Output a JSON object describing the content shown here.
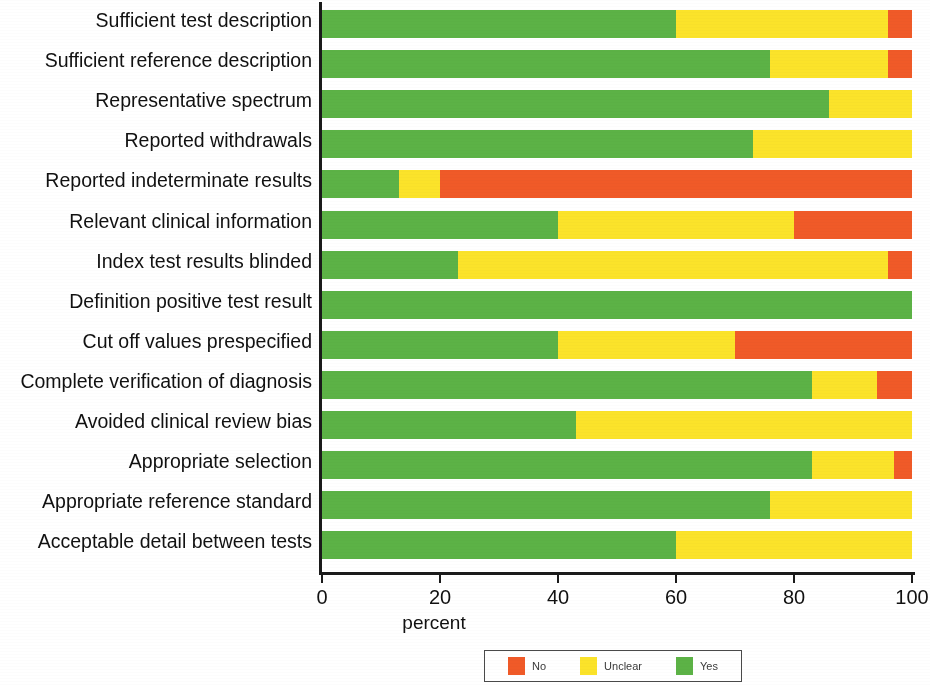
{
  "chart_data": {
    "type": "bar",
    "orientation": "horizontal",
    "stacked": true,
    "stack_mode": "percent",
    "title": "",
    "xlabel": "percent",
    "ylabel": "",
    "xlim": [
      0,
      100
    ],
    "xticks": [
      "0",
      "20",
      "40",
      "60",
      "80",
      "100"
    ],
    "grid": false,
    "legend_position": "bottom-center",
    "categories": [
      "Sufficient test description",
      "Sufficient reference description",
      "Representative spectrum",
      "Reported withdrawals",
      "Reported indeterminate results",
      "Relevant clinical information",
      "Index test results blinded",
      "Definition positive test result",
      "Cut off values prespecified",
      "Complete verification of diagnosis",
      "Avoided clinical review bias",
      "Appropriate selection",
      "Appropriate reference standard",
      "Acceptable detail between tests"
    ],
    "series": [
      {
        "name": "Yes",
        "color": "#5cb246",
        "values": [
          60,
          76,
          86,
          73,
          13,
          40,
          23,
          100,
          40,
          83,
          43,
          83,
          76,
          60
        ]
      },
      {
        "name": "Unclear",
        "color": "#fbe32a",
        "values": [
          36,
          20,
          14,
          27,
          7,
          40,
          73,
          0,
          30,
          11,
          57,
          14,
          24,
          40
        ]
      },
      {
        "name": "No",
        "color": "#f05a28",
        "values": [
          4,
          4,
          0,
          0,
          80,
          20,
          4,
          0,
          30,
          6,
          0,
          3,
          0,
          0
        ]
      }
    ],
    "legend": [
      {
        "label": "No",
        "color": "#f05a28"
      },
      {
        "label": "Unclear",
        "color": "#fbe32a"
      },
      {
        "label": "Yes",
        "color": "#5cb246"
      }
    ]
  }
}
